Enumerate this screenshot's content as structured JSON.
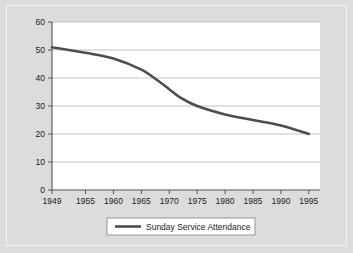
{
  "figure": {
    "background_color": "#dcdcdc",
    "plot_background_color": "#ffffff",
    "frame_color": "#f2f2f2"
  },
  "chart_data": {
    "type": "line",
    "title": "",
    "subtitle": "",
    "xlabel": "",
    "ylabel": "",
    "grid": "horizontal",
    "legend_position": "bottom",
    "xlim": [
      1949,
      1997
    ],
    "ylim": [
      0,
      60
    ],
    "ytick_labels": [
      "0",
      "10",
      "20",
      "30",
      "40",
      "50",
      "60"
    ],
    "yticks": [
      0,
      10,
      20,
      30,
      40,
      50,
      60
    ],
    "xtick_labels": [
      "1949",
      "1955",
      "1960",
      "1965",
      "1970",
      "1975",
      "1980",
      "1985",
      "1990",
      "1995"
    ],
    "xticks": [
      1949,
      1955,
      1960,
      1965,
      1970,
      1975,
      1980,
      1985,
      1990,
      1995
    ],
    "series": [
      {
        "name": "Sunday Service Attendance",
        "color": "#4d4d4d",
        "line_width": 2.6,
        "x": [
          1949,
          1955,
          1960,
          1965,
          1968,
          1970,
          1972,
          1975,
          1980,
          1985,
          1990,
          1995
        ],
        "values": [
          51,
          49,
          47,
          43,
          39,
          36,
          33,
          30,
          27,
          25,
          23,
          20
        ]
      }
    ]
  },
  "legend": {
    "entries": [
      {
        "label": "Sunday Service Attendance",
        "color": "#4d4d4d"
      }
    ]
  }
}
